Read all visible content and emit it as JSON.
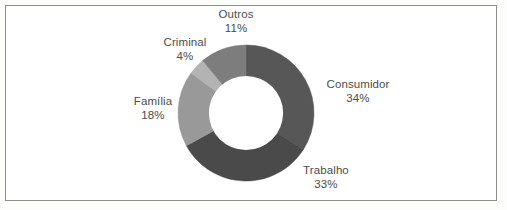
{
  "figure": {
    "background_color": "#ffffff",
    "border_color": "#8d8d8d",
    "text_color": "#4c4c4c"
  },
  "chart_data": {
    "type": "pie",
    "variant": "donut",
    "title": "",
    "subtitle": "",
    "xlabel": "",
    "ylabel": "",
    "legend_position": "none",
    "labels_position": "outside",
    "grid": false,
    "units": "percent",
    "total": 100,
    "start_angle_deg": 0,
    "direction": "clockwise",
    "inner_radius_ratio": 0.545,
    "categories": [
      "Consumidor",
      "Trabalho",
      "Familia",
      "Criminal",
      "Outros"
    ],
    "values": [
      34,
      33,
      18,
      4,
      11
    ],
    "colors": [
      "#575757",
      "#4a4a4a",
      "#999999",
      "#b3b3b3",
      "#7d7d7d"
    ],
    "slices": [
      {
        "name": "Consumidor",
        "value": 34,
        "value_label": "34%",
        "color": "#575757",
        "start_deg": 0,
        "end_deg": 122.4
      },
      {
        "name": "Trabalho",
        "value": 33,
        "value_label": "33%",
        "color": "#4a4a4a",
        "start_deg": 122.4,
        "end_deg": 241.2
      },
      {
        "name": "Familia",
        "value": 18,
        "value_label": "18%",
        "color": "#999999",
        "start_deg": 241.2,
        "end_deg": 306.0
      },
      {
        "name": "Criminal",
        "value": 4,
        "value_label": "4%",
        "color": "#b3b3b3",
        "start_deg": 306.0,
        "end_deg": 320.4
      },
      {
        "name": "Outros",
        "value": 11,
        "value_label": "11%",
        "color": "#7d7d7d",
        "start_deg": 320.4,
        "end_deg": 360.0
      }
    ]
  },
  "labels": {
    "outros": {
      "name": "Outros",
      "pct": "11%"
    },
    "criminal": {
      "name": "Criminal",
      "pct": "4%"
    },
    "familia": {
      "name": "Família",
      "pct": "18%"
    },
    "consumidor": {
      "name": "Consumidor",
      "pct": "34%"
    },
    "trabalho": {
      "name": "Trabalho",
      "pct": "33%"
    }
  }
}
